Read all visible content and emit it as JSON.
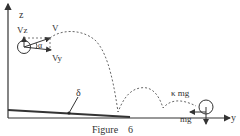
{
  "figure": {
    "caption": "Figure    6",
    "axes": {
      "z_label": "z",
      "y_label": "y"
    },
    "labels": {
      "vz": "Vz",
      "v": "V",
      "vy": "Vy",
      "alpha": "α",
      "delta": "δ",
      "friction": "κ mg",
      "weight": "mg"
    },
    "colors": {
      "ink": "#333333",
      "background": "#ffffff"
    }
  }
}
